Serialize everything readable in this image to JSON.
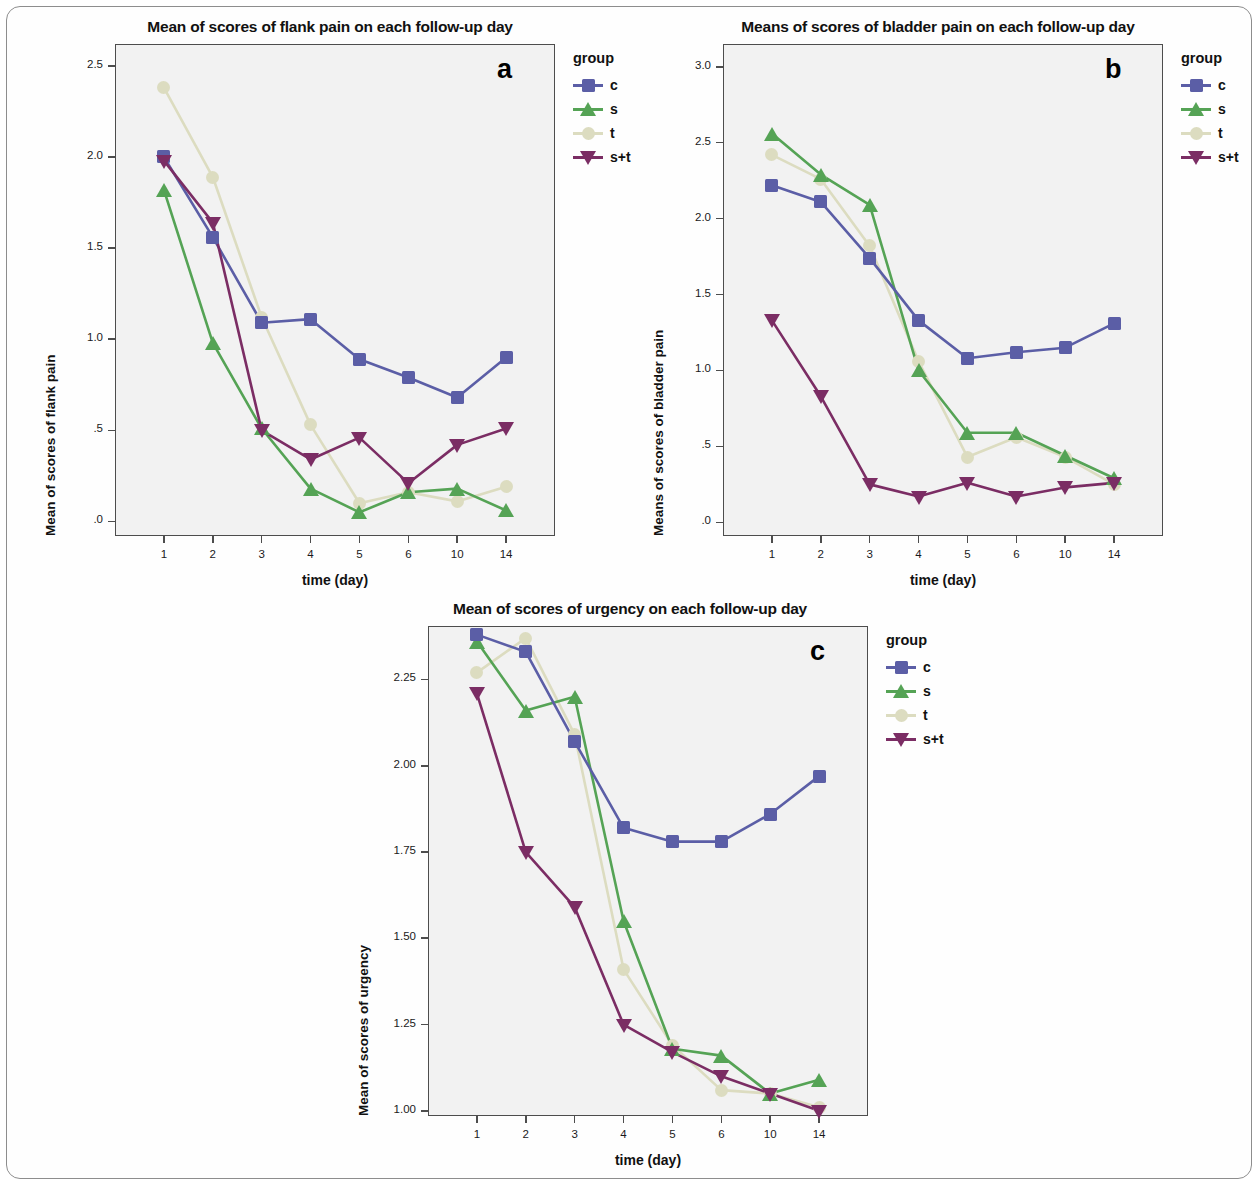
{
  "figure": {
    "panels": [
      "a",
      "b",
      "c"
    ]
  },
  "legend": {
    "title": "group",
    "entries": [
      {
        "label": "c",
        "color": "#5b5ea6",
        "marker": "square"
      },
      {
        "label": "s",
        "color": "#55a355",
        "marker": "triangle-up"
      },
      {
        "label": "t",
        "color": "#dcdcc0",
        "marker": "circle"
      },
      {
        "label": "s+t",
        "color": "#7b2d64",
        "marker": "triangle-down"
      }
    ]
  },
  "chart_data": [
    {
      "id": "a",
      "panel_letter": "a",
      "type": "line",
      "title": "Mean of scores of flank pain on each follow-up day",
      "xlabel": "time (day)",
      "ylabel": "Mean of scores of flank pain",
      "x": [
        "1",
        "2",
        "3",
        "4",
        "5",
        "6",
        "10",
        "14"
      ],
      "ytick_labels": [
        "2.5",
        "2.0",
        "1.5",
        "1.0",
        ".5",
        ".0"
      ],
      "ytick_values": [
        2.5,
        2.0,
        1.5,
        1.0,
        0.5,
        0.0
      ],
      "ylim": [
        -0.08,
        2.62
      ],
      "grid": false,
      "legend_position": "right",
      "series": [
        {
          "name": "c",
          "color": "#5b5ea6",
          "marker": "square",
          "values": [
            2.0,
            1.56,
            1.09,
            1.11,
            0.89,
            0.79,
            0.68,
            0.9
          ]
        },
        {
          "name": "s",
          "color": "#55a355",
          "marker": "triangle-up",
          "values": [
            1.82,
            0.98,
            0.51,
            0.18,
            0.05,
            0.16,
            0.18,
            0.06
          ]
        },
        {
          "name": "t",
          "color": "#dcdcc0",
          "marker": "circle",
          "values": [
            2.38,
            1.89,
            1.12,
            0.53,
            0.1,
            0.16,
            0.11,
            0.19
          ]
        },
        {
          "name": "s+t",
          "color": "#7b2d64",
          "marker": "triangle-down",
          "values": [
            1.98,
            1.64,
            0.5,
            0.34,
            0.46,
            0.21,
            0.42,
            0.51
          ]
        }
      ]
    },
    {
      "id": "b",
      "panel_letter": "b",
      "type": "line",
      "title": "Means of scores of bladder pain on each follow-up day",
      "xlabel": "time (day)",
      "ylabel": "Means of scores of bladder pain",
      "x": [
        "1",
        "2",
        "3",
        "4",
        "5",
        "6",
        "10",
        "14"
      ],
      "ytick_labels": [
        "3.0",
        "2.5",
        "2.0",
        "1.5",
        "1.0",
        ".5",
        ".0"
      ],
      "ytick_values": [
        3.0,
        2.5,
        2.0,
        1.5,
        1.0,
        0.5,
        0.0
      ],
      "ylim": [
        -0.09,
        3.15
      ],
      "grid": false,
      "legend_position": "right",
      "series": [
        {
          "name": "c",
          "color": "#5b5ea6",
          "marker": "square",
          "values": [
            2.22,
            2.11,
            1.74,
            1.33,
            1.08,
            1.12,
            1.15,
            1.31
          ]
        },
        {
          "name": "s",
          "color": "#55a355",
          "marker": "triangle-up",
          "values": [
            2.56,
            2.29,
            2.09,
            1.0,
            0.59,
            0.59,
            0.44,
            0.29
          ]
        },
        {
          "name": "t",
          "color": "#dcdcc0",
          "marker": "circle",
          "values": [
            2.42,
            2.26,
            1.82,
            1.06,
            0.43,
            0.56,
            0.43,
            0.25
          ]
        },
        {
          "name": "s+t",
          "color": "#7b2d64",
          "marker": "triangle-down",
          "values": [
            1.33,
            0.83,
            0.25,
            0.17,
            0.26,
            0.17,
            0.23,
            0.26
          ]
        }
      ]
    },
    {
      "id": "c",
      "panel_letter": "c",
      "type": "line",
      "title": "Mean of scores of urgency on each follow-up day",
      "xlabel": "time (day)",
      "ylabel": "Mean of scores of urgency",
      "x": [
        "1",
        "2",
        "3",
        "4",
        "5",
        "6",
        "10",
        "14"
      ],
      "ytick_labels": [
        "2.25",
        "2.00",
        "1.75",
        "1.50",
        "1.25",
        "1.00"
      ],
      "ytick_values": [
        2.25,
        2.0,
        1.75,
        1.5,
        1.25,
        1.0
      ],
      "ylim": [
        0.985,
        2.405
      ],
      "grid": false,
      "legend_position": "right",
      "series": [
        {
          "name": "c",
          "color": "#5b5ea6",
          "marker": "square",
          "values": [
            2.38,
            2.33,
            2.07,
            1.82,
            1.78,
            1.78,
            1.86,
            1.97
          ]
        },
        {
          "name": "s",
          "color": "#55a355",
          "marker": "triangle-up",
          "values": [
            2.36,
            2.16,
            2.2,
            1.55,
            1.18,
            1.16,
            1.05,
            1.09
          ]
        },
        {
          "name": "t",
          "color": "#dcdcc0",
          "marker": "circle",
          "values": [
            2.27,
            2.37,
            2.09,
            1.41,
            1.19,
            1.06,
            1.05,
            1.01
          ]
        },
        {
          "name": "s+t",
          "color": "#7b2d64",
          "marker": "triangle-down",
          "values": [
            2.21,
            1.75,
            1.59,
            1.25,
            1.17,
            1.1,
            1.05,
            1.0
          ]
        }
      ]
    }
  ]
}
